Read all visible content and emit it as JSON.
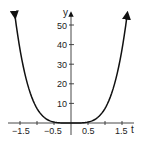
{
  "chart_data": {
    "type": "line",
    "title": "",
    "xlabel": "t",
    "ylabel": "y",
    "xlim": [
      -1.7,
      1.7
    ],
    "ylim": [
      0,
      56
    ],
    "grid": false,
    "legend": null,
    "x_ticks": [
      -1.5,
      -1,
      -0.5,
      0.5,
      1,
      1.5
    ],
    "x_tick_labels": [
      "-1.5",
      "",
      "-0.5",
      "0.5",
      "",
      "1.5"
    ],
    "y_ticks": [
      10,
      20,
      30,
      40,
      50
    ],
    "y_tick_labels": [
      "10",
      "20",
      "30",
      "40",
      "50"
    ],
    "series": [
      {
        "name": "y = k t^4",
        "x": [
          -1.65,
          -1.5,
          -1.25,
          -1.0,
          -0.75,
          -0.5,
          -0.25,
          0,
          0.25,
          0.5,
          0.75,
          1.0,
          1.25,
          1.5,
          1.65
        ],
        "values": [
          55,
          45.6,
          22,
          9,
          2.8,
          0.6,
          0.04,
          0,
          0.04,
          0.6,
          2.8,
          9,
          22,
          45.6,
          55
        ]
      }
    ],
    "annotations": [
      "arrowheads at curve ends",
      "arrowheads on axes"
    ]
  },
  "axes": {
    "x_label": "t",
    "y_label": "y",
    "x_tick_labels": [
      "−1.5",
      "−0.5",
      "0.5",
      "1.5"
    ],
    "y_tick_labels": [
      "10",
      "20",
      "30",
      "40",
      "50"
    ]
  }
}
